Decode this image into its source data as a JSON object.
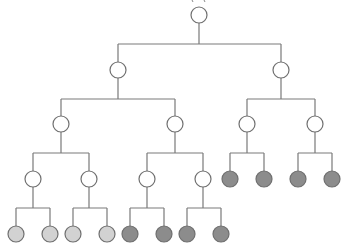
{
  "diagram": {
    "type": "tree",
    "colors": {
      "edge": "#7a7a7a",
      "outline": "#6f6f6f",
      "white": "#ffffff",
      "light": "#d2d2d2",
      "dark": "#8c8c8c"
    },
    "node_radius": 8,
    "nodes": [
      {
        "id": "root",
        "x": 199,
        "y": 15,
        "fill": "white"
      },
      {
        "id": "L2a",
        "x": 118,
        "y": 70,
        "fill": "white",
        "parent": "root"
      },
      {
        "id": "L2b",
        "x": 281,
        "y": 70,
        "fill": "white",
        "parent": "root"
      },
      {
        "id": "L3a",
        "x": 61,
        "y": 124,
        "fill": "white",
        "parent": "L2a"
      },
      {
        "id": "L3b",
        "x": 175,
        "y": 124,
        "fill": "white",
        "parent": "L2a"
      },
      {
        "id": "L3c",
        "x": 247,
        "y": 124,
        "fill": "white",
        "parent": "L2b"
      },
      {
        "id": "L3d",
        "x": 315,
        "y": 124,
        "fill": "white",
        "parent": "L2b"
      },
      {
        "id": "L4a",
        "x": 33,
        "y": 179,
        "fill": "white",
        "parent": "L3a"
      },
      {
        "id": "L4b",
        "x": 89,
        "y": 179,
        "fill": "white",
        "parent": "L3a"
      },
      {
        "id": "L4c",
        "x": 147,
        "y": 179,
        "fill": "white",
        "parent": "L3b"
      },
      {
        "id": "L4d",
        "x": 203,
        "y": 179,
        "fill": "white",
        "parent": "L3b"
      },
      {
        "id": "L4e",
        "x": 230,
        "y": 179,
        "fill": "dark",
        "parent": "L3c"
      },
      {
        "id": "L4f",
        "x": 264,
        "y": 179,
        "fill": "dark",
        "parent": "L3c"
      },
      {
        "id": "L4g",
        "x": 298,
        "y": 179,
        "fill": "dark",
        "parent": "L3d"
      },
      {
        "id": "L4h",
        "x": 332,
        "y": 179,
        "fill": "dark",
        "parent": "L3d"
      },
      {
        "id": "L5a",
        "x": 16,
        "y": 234,
        "fill": "light",
        "parent": "L4a"
      },
      {
        "id": "L5b",
        "x": 50,
        "y": 234,
        "fill": "light",
        "parent": "L4a"
      },
      {
        "id": "L5c",
        "x": 73,
        "y": 234,
        "fill": "light",
        "parent": "L4b"
      },
      {
        "id": "L5d",
        "x": 107,
        "y": 234,
        "fill": "light",
        "parent": "L4b"
      },
      {
        "id": "L5e",
        "x": 130,
        "y": 234,
        "fill": "dark",
        "parent": "L4c"
      },
      {
        "id": "L5f",
        "x": 164,
        "y": 234,
        "fill": "dark",
        "parent": "L4c"
      },
      {
        "id": "L5g",
        "x": 187,
        "y": 234,
        "fill": "dark",
        "parent": "L4d"
      },
      {
        "id": "L5h",
        "x": 221,
        "y": 234,
        "fill": "dark",
        "parent": "L4d"
      }
    ]
  }
}
